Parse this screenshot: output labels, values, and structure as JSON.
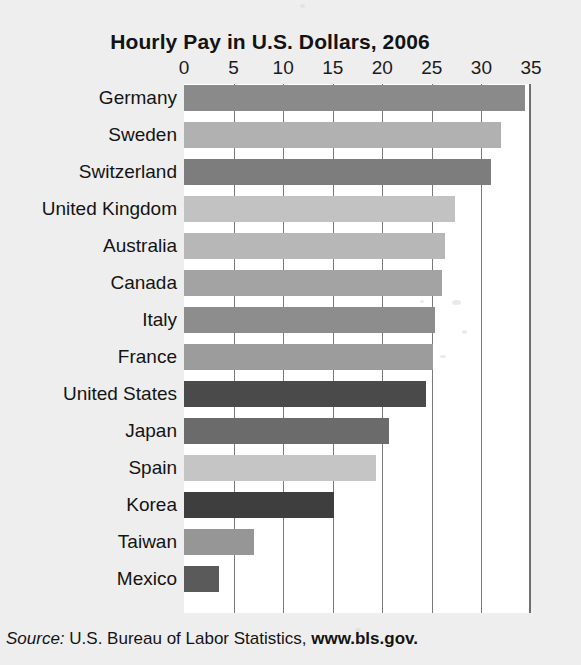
{
  "chart_data": {
    "type": "bar",
    "orientation": "horizontal",
    "title": "Hourly Pay in U.S. Dollars, 2006",
    "xlabel": "",
    "ylabel": "",
    "xlim": [
      0,
      35
    ],
    "xticks": [
      0,
      5,
      10,
      15,
      20,
      25,
      30,
      35
    ],
    "xtick_labels": [
      "0",
      "5",
      "10",
      "15",
      "20",
      "25",
      "30",
      "35"
    ],
    "grid": true,
    "grid_axis": "x",
    "legend": "none",
    "categories": [
      "Germany",
      "Sweden",
      "Switzerland",
      "United Kingdom",
      "Australia",
      "Canada",
      "Italy",
      "France",
      "United States",
      "Japan",
      "Spain",
      "Korea",
      "Taiwan",
      "Mexico"
    ],
    "values": [
      34.4,
      32.0,
      31.0,
      27.3,
      26.3,
      26.0,
      25.3,
      25.1,
      24.4,
      20.7,
      19.4,
      15.1,
      7.1,
      3.5
    ],
    "bar_colors": [
      "#8a8a8a",
      "#b1b1b1",
      "#7d7d7d",
      "#c2c2c2",
      "#b7b7b7",
      "#a3a3a3",
      "#8d8d8d",
      "#9c9c9c",
      "#4a4a4a",
      "#6b6b6b",
      "#c5c5c5",
      "#3e3e3e",
      "#969696",
      "#5a5a5a"
    ]
  },
  "source": {
    "label": "Source:",
    "text": " U.S. Bureau of Labor Statistics, ",
    "url": "www.bls.gov."
  },
  "colors": {
    "background": "#eeeeee",
    "plot_background": "#ffffff",
    "gridline": "#7a7a7a",
    "axis_border": "#6f6f6f",
    "text": "#141414"
  }
}
